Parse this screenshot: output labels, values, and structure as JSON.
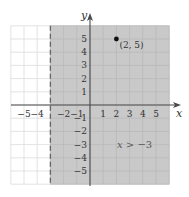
{
  "chart_data": {
    "type": "scatter",
    "title": "",
    "xlabel": "x",
    "ylabel": "y",
    "xlim": [
      -6,
      6
    ],
    "ylim": [
      -6,
      6
    ],
    "grid": true,
    "x_ticks": [
      -5,
      -4,
      -2,
      -1,
      1,
      2,
      3,
      4,
      5
    ],
    "x_tick_labels": [
      "−5",
      "−4",
      "−2",
      "−1",
      "1",
      "2",
      "3",
      "4",
      "5"
    ],
    "y_ticks": [
      5,
      4,
      3,
      2,
      1,
      -1,
      -2,
      -3,
      -4,
      -5
    ],
    "y_tick_labels": [
      "5",
      "4",
      "3",
      "2",
      "1",
      "−1",
      "−2",
      "−3",
      "−4",
      "−5"
    ],
    "boundary": {
      "type": "vertical-line",
      "x": -3,
      "style": "dashed"
    },
    "shaded_region": {
      "inequality": "x > -3",
      "from_x": -3,
      "to_x": 6
    },
    "points": [
      {
        "x": 2,
        "y": 5,
        "label": "(2, 5)"
      }
    ],
    "annotations": [
      {
        "text": "x > −3",
        "x": 3,
        "y": -3
      }
    ]
  },
  "labels": {
    "x_axis": "x",
    "y_axis": "y",
    "point_label": "(2, 5)",
    "inequality_var": "x",
    "inequality_rest": " > −3"
  },
  "colors": {
    "shade": "#c9c9c9",
    "grid_shaded": "#b9b9b9",
    "grid_unshaded": "#dcdcdc",
    "axis": "#4a4a4a",
    "text": "#333333"
  }
}
